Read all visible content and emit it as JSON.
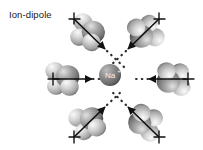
{
  "figure": {
    "caption": "Ion-dipole",
    "background_color": "#ffffff",
    "width": 203,
    "height": 150
  },
  "central_ion": {
    "label": "Na",
    "charge": "+",
    "cx": 110,
    "cy": 75,
    "r": 11,
    "fill_color": "#8c8c8c",
    "highlight_color": "#c9c9c9",
    "shadow_color": "#4f4f4f",
    "label_color": "#f2f2f2"
  },
  "palette": {
    "oxygen_color": "#8a8a8a",
    "oxygen_highlight": "#d6d6d6",
    "hydrogen_color": "#bdbdbd",
    "hydrogen_highlight": "#f0f0f0",
    "arrow_color": "#111111",
    "dotted_color": "#2b2b2b",
    "text_color": "#1a1a1a"
  },
  "interaction_lines": {
    "style": "dotted",
    "stroke_width": 2.2,
    "dash_pattern": "0.5 5",
    "count": 6
  },
  "molecules": [
    {
      "name": "water-top-left",
      "species": "H2O",
      "cx": 89,
      "cy": 33,
      "arrow_angle_deg": 47,
      "arrow_from": [
        74,
        20
      ],
      "arrow_to": [
        104,
        48
      ],
      "dot_from": [
        109,
        53
      ],
      "dot_to": [
        124,
        67
      ],
      "cross_at": [
        74,
        20
      ],
      "dipole_direction": "toward-ion"
    },
    {
      "name": "water-top-right",
      "species": "H2O",
      "cx": 144,
      "cy": 33,
      "arrow_angle_deg": 133,
      "arrow_to": [
        129,
        48
      ],
      "arrow_from": [
        159,
        20
      ],
      "dot_from": [
        124,
        53
      ],
      "dot_to": [
        110,
        64
      ],
      "cross_at": [
        159,
        20
      ],
      "dipole_direction": "toward-ion"
    },
    {
      "name": "water-left",
      "species": "H2O",
      "cx": 64,
      "cy": 79,
      "arrow_angle_deg": 0,
      "arrow_from": [
        53,
        79
      ],
      "arrow_to": [
        91,
        79
      ],
      "dot_from": [
        96,
        79
      ],
      "dot_to": [
        110,
        79
      ],
      "cross_at": [
        53,
        79
      ],
      "dipole_direction": "toward-ion"
    },
    {
      "name": "water-right",
      "species": "H2O",
      "cx": 172,
      "cy": 79,
      "arrow_angle_deg": 180,
      "arrow_from": [
        187,
        79
      ],
      "arrow_to": [
        150,
        79
      ],
      "dot_from": [
        145,
        79
      ],
      "dot_to": [
        131,
        79
      ],
      "cross_at": [
        187,
        79
      ],
      "dipole_direction": "toward-ion"
    },
    {
      "name": "water-bottom-left",
      "species": "H2O",
      "cx": 89,
      "cy": 122,
      "arrow_angle_deg": -47,
      "arrow_from": [
        74,
        136
      ],
      "arrow_to": [
        104,
        108
      ],
      "dot_from": [
        109,
        103
      ],
      "dot_to": [
        122,
        90
      ],
      "cross_at": [
        74,
        136
      ],
      "dipole_direction": "toward-ion"
    },
    {
      "name": "water-bottom-right",
      "species": "H2O",
      "cx": 144,
      "cy": 122,
      "arrow_angle_deg": -133,
      "arrow_from": [
        159,
        136
      ],
      "arrow_to": [
        129,
        108
      ],
      "dot_from": [
        124,
        103
      ],
      "dot_to": [
        111,
        90
      ],
      "cross_at": [
        159,
        136
      ],
      "dipole_direction": "toward-ion"
    }
  ],
  "legend": {
    "positive_marker": "+",
    "negative_marker": "−"
  }
}
